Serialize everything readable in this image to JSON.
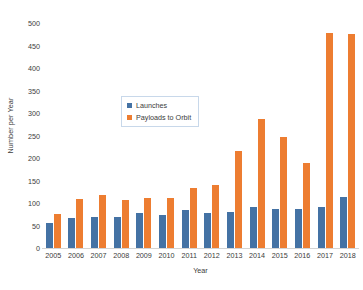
{
  "chart_data": {
    "type": "bar",
    "title": "",
    "xlabel": "Year",
    "ylabel": "Number per Year",
    "categories": [
      "2005",
      "2006",
      "2007",
      "2008",
      "2009",
      "2010",
      "2011",
      "2012",
      "2013",
      "2014",
      "2015",
      "2016",
      "2017",
      "2018"
    ],
    "series": [
      {
        "name": "Launches",
        "color": "#4472a4",
        "values": [
          55,
          66,
          68,
          69,
          78,
          74,
          84,
          78,
          81,
          92,
          87,
          86,
          91,
          114
        ]
      },
      {
        "name": "Payloads to Orbit",
        "color": "#ed7d31",
        "values": [
          75,
          108,
          117,
          106,
          111,
          111,
          134,
          140,
          215,
          287,
          247,
          189,
          478,
          475
        ]
      }
    ],
    "ylim": [
      0,
      500
    ],
    "ytick_step": 50,
    "yticks": [
      "0",
      "50",
      "100",
      "150",
      "200",
      "250",
      "300",
      "350",
      "400",
      "450",
      "500"
    ],
    "grid": false,
    "legend_position": "inside-upper-center"
  },
  "legend": {
    "items": [
      {
        "label": "Launches",
        "swatch": "launches"
      },
      {
        "label": "Payloads to Orbit",
        "swatch": "payloads"
      }
    ]
  },
  "colors": {
    "launches": "#4472a4",
    "payloads": "#ed7d31",
    "axis": "#d4d4d4",
    "text": "#3b3b3b",
    "legend_border": "#c8d8ea",
    "background": "#ffffff"
  }
}
